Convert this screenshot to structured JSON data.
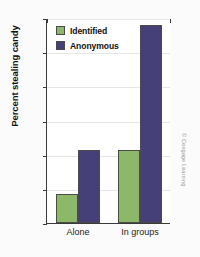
{
  "chart_data": {
    "type": "bar",
    "title": "",
    "xlabel": "",
    "ylabel": "Percent stealing candy",
    "categories": [
      "Alone",
      "In groups"
    ],
    "ylim": [
      0,
      60
    ],
    "yticks": [
      0,
      10,
      20,
      30,
      40,
      50,
      60
    ],
    "grid": true,
    "legend_position": "top-left",
    "series": [
      {
        "name": "Identified",
        "color": "#8db86a",
        "values": [
          8.5,
          21.5
        ]
      },
      {
        "name": "Anonymous",
        "color": "#454077",
        "values": [
          21.5,
          58.0
        ]
      }
    ]
  },
  "credit": {
    "text": "© Cengage Learning"
  }
}
